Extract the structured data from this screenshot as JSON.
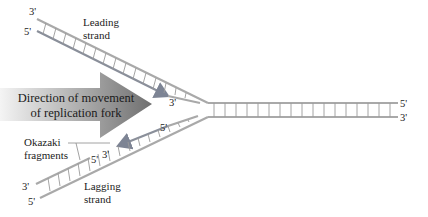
{
  "diagram": {
    "colors": {
      "strand": "#a9a9a9",
      "rung": "#9a9a9a",
      "new_strand_arrow": "#8a8f9a",
      "fork_arrow_light": "#f2f2f2",
      "fork_arrow_mid": "#8c8c8c",
      "fork_arrow_dark": "#6e6e6e",
      "text": "#222222"
    },
    "leading_strand": {
      "label_line1": "Leading",
      "label_line2": "strand",
      "end_top": "3'",
      "end_bottom": "5'",
      "new_strand_end": "3'"
    },
    "lagging_strand": {
      "label_line1": "Lagging",
      "label_line2": "strand",
      "end_top": "3'",
      "end_bottom": "5'",
      "fragment_end_5": "5'",
      "fragment_end_3": "3'",
      "fragment2_end_5": "5'",
      "fragment2_end_3": "3'"
    },
    "parent_duplex": {
      "end_top": "5'",
      "end_bottom": "3'"
    },
    "fork_arrow": {
      "line1": "Direction of movement",
      "line2": "of replication fork"
    },
    "okazaki": {
      "label_line1": "Okazaki",
      "label_line2": "fragments"
    }
  }
}
